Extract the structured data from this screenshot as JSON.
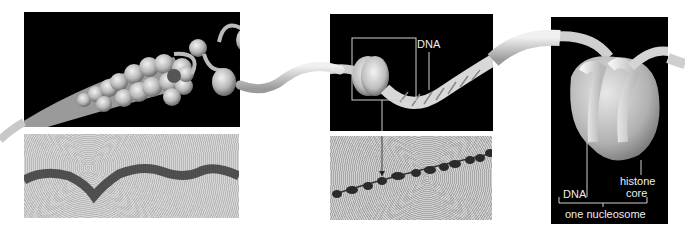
{
  "figure": {
    "panels": [
      {
        "id": "chromatin-fiber",
        "description": "30-nm chromatin fiber unwinding into nucleosomes"
      },
      {
        "id": "beads-on-string",
        "description": "nucleosomes on DNA, boxed nucleosome"
      },
      {
        "id": "nucleosome-detail",
        "description": "single nucleosome: DNA wrapped around histone core"
      }
    ],
    "micrographs": [
      {
        "id": "fiber-micrograph",
        "description": "electron micrograph of chromatin fiber"
      },
      {
        "id": "beads-micrograph",
        "description": "electron micrograph of beads-on-a-string"
      }
    ],
    "labels": {
      "dna_top": "DNA",
      "dna_nucleosome": "DNA",
      "histone_line1": "histone",
      "histone_line2": "core",
      "nucleosome": "one nucleosome"
    },
    "colors": {
      "panel_bg": "#000000",
      "micrograph_bg": "#cfcfcf",
      "strand": "#d8d8d8",
      "label": "#eeeeee"
    }
  }
}
